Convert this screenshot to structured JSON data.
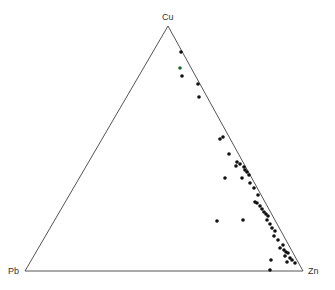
{
  "diagram": {
    "type": "ternary",
    "vertices": {
      "top": {
        "label": "Cu",
        "x": 168,
        "y": 26
      },
      "left": {
        "label": "Pb",
        "x": 25,
        "y": 271
      },
      "right": {
        "label": "Zn",
        "x": 303,
        "y": 271
      }
    },
    "colors": {
      "line": "#555555",
      "point": "#111111",
      "highlight": "#1a6b2a"
    }
  },
  "chart_data": {
    "type": "scatter",
    "title": "",
    "axes": [
      "Cu",
      "Pb",
      "Zn"
    ],
    "points_px": [
      [
        181,
        52,
        "b"
      ],
      [
        180,
        68,
        "g"
      ],
      [
        182,
        76,
        "b"
      ],
      [
        198,
        84,
        "b"
      ],
      [
        199,
        97,
        "b"
      ],
      [
        220,
        139,
        "b"
      ],
      [
        223,
        137,
        "b"
      ],
      [
        229,
        154,
        "b"
      ],
      [
        237,
        162,
        "b"
      ],
      [
        240,
        164,
        "b"
      ],
      [
        236,
        166,
        "b"
      ],
      [
        244,
        167,
        "b"
      ],
      [
        245,
        170,
        "b"
      ],
      [
        247,
        172,
        "b"
      ],
      [
        249,
        175,
        "b"
      ],
      [
        225,
        178,
        "b"
      ],
      [
        242,
        178,
        "b"
      ],
      [
        250,
        183,
        "b"
      ],
      [
        254,
        188,
        "b"
      ],
      [
        258,
        195,
        "b"
      ],
      [
        255,
        202,
        "b"
      ],
      [
        257,
        203,
        "b"
      ],
      [
        260,
        206,
        "b"
      ],
      [
        262,
        209,
        "b"
      ],
      [
        264,
        212,
        "b"
      ],
      [
        266,
        214,
        "b"
      ],
      [
        268,
        216,
        "b"
      ],
      [
        267,
        220,
        "b"
      ],
      [
        270,
        224,
        "b"
      ],
      [
        272,
        228,
        "b"
      ],
      [
        275,
        231,
        "b"
      ],
      [
        274,
        236,
        "b"
      ],
      [
        278,
        240,
        "b"
      ],
      [
        283,
        245,
        "b"
      ],
      [
        280,
        248,
        "b"
      ],
      [
        284,
        250,
        "b"
      ],
      [
        286,
        252,
        "b"
      ],
      [
        288,
        253,
        "b"
      ],
      [
        285,
        256,
        "b"
      ],
      [
        290,
        258,
        "b"
      ],
      [
        292,
        260,
        "b"
      ],
      [
        287,
        262,
        "b"
      ],
      [
        295,
        263,
        "b"
      ],
      [
        271,
        260,
        "b"
      ],
      [
        270,
        270,
        "b"
      ],
      [
        217,
        221,
        "b"
      ],
      [
        243,
        220,
        "b"
      ]
    ]
  }
}
